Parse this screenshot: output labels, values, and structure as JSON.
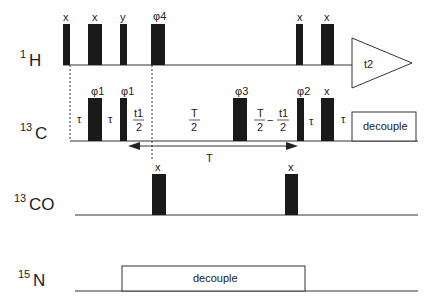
{
  "channels": [
    {
      "nucleus": "1H",
      "mass": "1",
      "element": "H"
    },
    {
      "nucleus": "13C",
      "mass": "13",
      "element": "C"
    },
    {
      "nucleus": "13CO",
      "mass": "13",
      "element": "CO"
    },
    {
      "nucleus": "15N",
      "mass": "15",
      "element": "N"
    }
  ],
  "h_pulses": [
    {
      "phase": "x"
    },
    {
      "phase": "x"
    },
    {
      "phase": "y"
    },
    {
      "phase": "φ4"
    },
    {
      "phase": "x"
    },
    {
      "phase": "x"
    }
  ],
  "h_acquisition": {
    "label": "t2"
  },
  "c_pulses": [
    {
      "phase": "φ1"
    },
    {
      "phase": "φ1"
    },
    {
      "phase": "φ3"
    },
    {
      "phase": "φ2"
    },
    {
      "phase": "x"
    }
  ],
  "c_delays": {
    "tau": "τ",
    "t1_half_num": "t1",
    "den": "2",
    "T_num": "T",
    "minus": "−"
  },
  "c_decouple": "decouple",
  "T_arrow": "T",
  "co_pulses": [
    {
      "phase": "x"
    },
    {
      "phase": "x"
    }
  ],
  "n_decouple": "decouple"
}
